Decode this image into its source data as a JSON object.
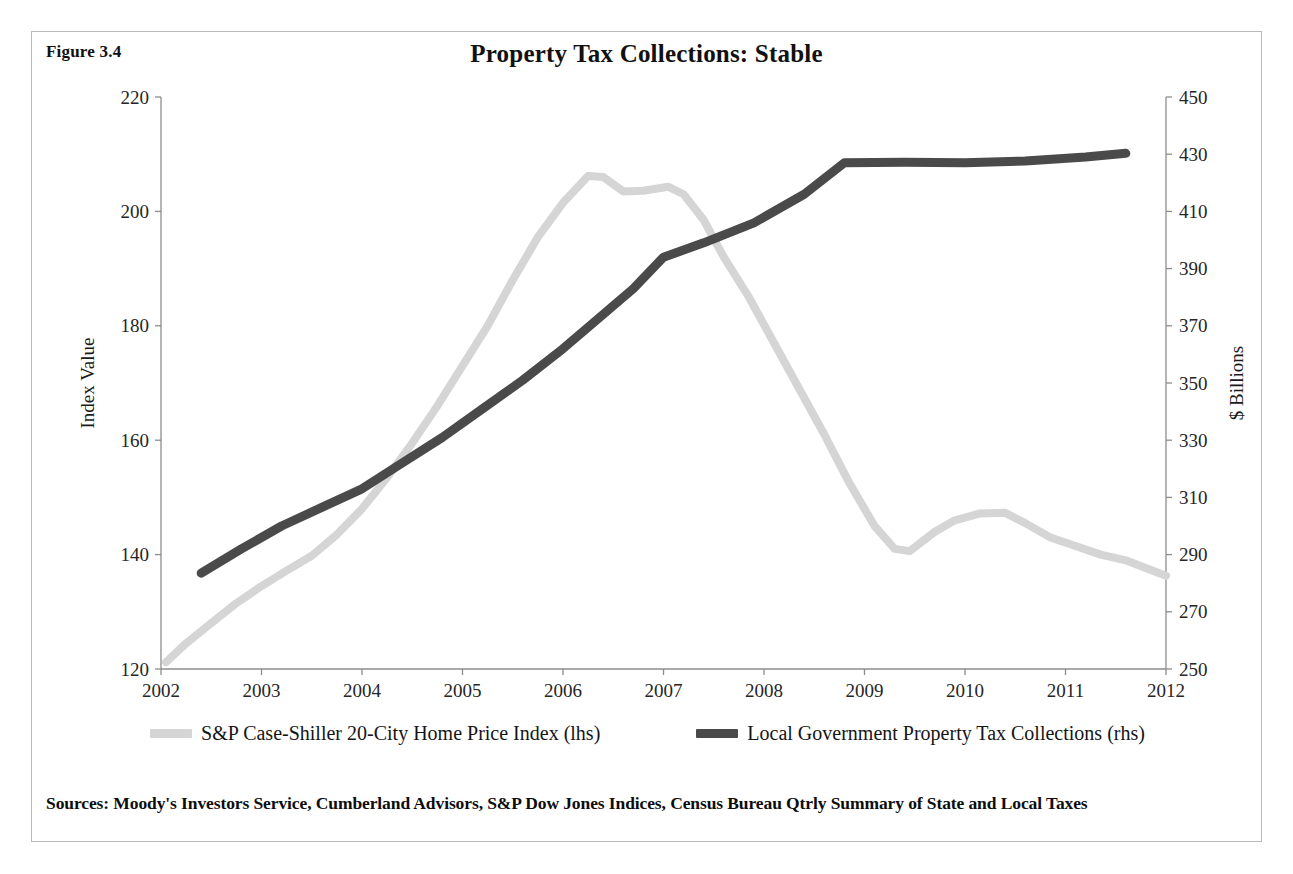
{
  "figure": {
    "label": "Figure 3.4",
    "title": "Property Tax Collections: Stable",
    "sources": "Sources: Moody's Investors Service, Cumberland Advisors, S&P Dow Jones Indices, Census Bureau Qtrly Summary of State and Local Taxes"
  },
  "legend": {
    "position": "bottom",
    "items": [
      {
        "label": "S&P Case-Shiller 20-City Home Price Index (lhs)",
        "color": "#d5d5d5"
      },
      {
        "label": "Local Government Property Tax Collections (rhs)",
        "color": "#4a4a4a"
      }
    ]
  },
  "colors": {
    "case_shiller": "#d5d5d5",
    "property_tax": "#4a4a4a",
    "axis": "#8d8d8d",
    "border": "#b9b9b9",
    "text": "#1a1a1a"
  },
  "chart_data": {
    "type": "line",
    "title": "Property Tax Collections: Stable",
    "xlabel": "",
    "ylabel": "Index Value",
    "y2label": "$ Billions",
    "grid": false,
    "legend_position": "bottom",
    "xlim": [
      2002,
      2012
    ],
    "ylim": [
      120,
      220
    ],
    "y2lim": [
      250,
      450
    ],
    "x_ticks": [
      "2002",
      "2003",
      "2004",
      "2005",
      "2006",
      "2007",
      "2008",
      "2009",
      "2010",
      "2011",
      "2012"
    ],
    "y_ticks": [
      "120",
      "140",
      "160",
      "180",
      "200",
      "220"
    ],
    "y2_ticks": [
      "250",
      "270",
      "290",
      "310",
      "330",
      "350",
      "370",
      "390",
      "410",
      "430",
      "450"
    ],
    "series": [
      {
        "name": "S&P Case-Shiller 20-City Home Price Index (lhs)",
        "axis": "left",
        "color": "#d5d5d5",
        "units": "Index Value",
        "points": [
          [
            2002.05,
            121.2
          ],
          [
            2002.25,
            124.5
          ],
          [
            2002.5,
            128.0
          ],
          [
            2002.75,
            131.5
          ],
          [
            2003.0,
            134.5
          ],
          [
            2003.25,
            137.2
          ],
          [
            2003.5,
            139.8
          ],
          [
            2003.75,
            143.5
          ],
          [
            2004.0,
            148.0
          ],
          [
            2004.25,
            153.5
          ],
          [
            2004.5,
            159.5
          ],
          [
            2004.75,
            166.0
          ],
          [
            2005.0,
            173.0
          ],
          [
            2005.25,
            180.0
          ],
          [
            2005.5,
            188.0
          ],
          [
            2005.75,
            195.5
          ],
          [
            2006.0,
            201.5
          ],
          [
            2006.25,
            206.2
          ],
          [
            2006.4,
            206.0
          ],
          [
            2006.6,
            203.5
          ],
          [
            2006.8,
            203.6
          ],
          [
            2007.05,
            204.3
          ],
          [
            2007.2,
            203.0
          ],
          [
            2007.4,
            198.5
          ],
          [
            2007.6,
            192.0
          ],
          [
            2007.85,
            185.0
          ],
          [
            2008.1,
            177.0
          ],
          [
            2008.35,
            169.0
          ],
          [
            2008.6,
            161.0
          ],
          [
            2008.85,
            152.5
          ],
          [
            2009.1,
            145.0
          ],
          [
            2009.3,
            141.0
          ],
          [
            2009.45,
            140.6
          ],
          [
            2009.7,
            144.0
          ],
          [
            2009.9,
            146.0
          ],
          [
            2010.15,
            147.2
          ],
          [
            2010.4,
            147.3
          ],
          [
            2010.6,
            145.5
          ],
          [
            2010.85,
            143.0
          ],
          [
            2011.1,
            141.5
          ],
          [
            2011.35,
            140.0
          ],
          [
            2011.6,
            139.0
          ],
          [
            2011.85,
            137.3
          ],
          [
            2012.0,
            136.3
          ]
        ]
      },
      {
        "name": "Local Government Property Tax Collections (rhs)",
        "axis": "right",
        "color": "#4a4a4a",
        "units": "$ Billions",
        "points": [
          [
            2002.4,
            283.5
          ],
          [
            2002.8,
            292.0
          ],
          [
            2003.2,
            300.0
          ],
          [
            2003.6,
            306.5
          ],
          [
            2004.0,
            313.0
          ],
          [
            2004.4,
            322.0
          ],
          [
            2004.8,
            331.0
          ],
          [
            2005.2,
            341.0
          ],
          [
            2005.6,
            351.0
          ],
          [
            2006.0,
            362.0
          ],
          [
            2006.4,
            374.0
          ],
          [
            2006.7,
            383.0
          ],
          [
            2007.0,
            394.0
          ],
          [
            2007.4,
            399.0
          ],
          [
            2007.9,
            406.0
          ],
          [
            2008.4,
            416.0
          ],
          [
            2008.8,
            427.0
          ],
          [
            2009.4,
            427.2
          ],
          [
            2010.0,
            427.0
          ],
          [
            2010.6,
            427.6
          ],
          [
            2011.2,
            429.0
          ],
          [
            2011.6,
            430.3
          ]
        ]
      }
    ]
  }
}
